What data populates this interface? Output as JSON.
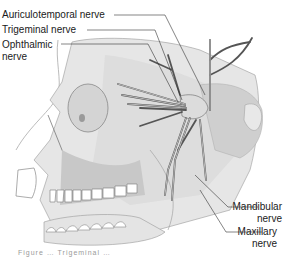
{
  "figure": {
    "labels": [
      {
        "id": "auriculotemporal",
        "text": "Auriculotemporal nerve"
      },
      {
        "id": "trigeminal",
        "text": "Trigeminal nerve"
      },
      {
        "id": "ophthalmic_line1",
        "text": "Ophthalmic"
      },
      {
        "id": "ophthalmic_line2",
        "text": "nerve"
      },
      {
        "id": "mandibular_line1",
        "text": "Mandibular"
      },
      {
        "id": "mandibular_line2",
        "text": "nerve"
      },
      {
        "id": "maxillary_line1",
        "text": "Maxillary"
      },
      {
        "id": "maxillary_line2",
        "text": "nerve"
      }
    ],
    "caption": "Figure … Trigeminal …",
    "colors": {
      "bone": "#e6e6e6",
      "bone_shade": "#cfcfcf",
      "outline": "#8c8c8c",
      "nerve": "#bdbdbd",
      "nerve_outline": "#555555",
      "leader": "#333333",
      "text": "#1a1a1a"
    }
  }
}
